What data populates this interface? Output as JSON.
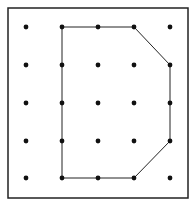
{
  "diagram": {
    "type": "geoboard",
    "grid": {
      "cols": 5,
      "rows": 5,
      "x": [
        26,
        62,
        98,
        134,
        170
      ],
      "y": [
        27,
        65,
        103,
        141,
        178
      ]
    },
    "frame": {
      "x": 8,
      "y": 8,
      "width": 180,
      "height": 190
    },
    "shape_vertices": [
      [
        1,
        0
      ],
      [
        2,
        0
      ],
      [
        3,
        0
      ],
      [
        4,
        1
      ],
      [
        4,
        2
      ],
      [
        4,
        3
      ],
      [
        3,
        4
      ],
      [
        2,
        4
      ],
      [
        1,
        4
      ],
      [
        1,
        3
      ],
      [
        1,
        2
      ],
      [
        1,
        1
      ]
    ],
    "shape_label": "D-shaped polygon",
    "colors": {
      "dot": "#111111",
      "line": "#222222",
      "frame": "#222222",
      "background": "#ffffff"
    }
  }
}
